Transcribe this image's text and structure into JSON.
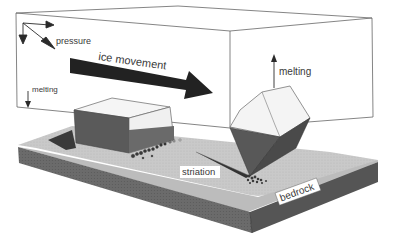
{
  "diagram": {
    "labels": {
      "pressure": "pressure",
      "ice_movement": "ice movement",
      "melting_left": "melting",
      "melting_right": "melting",
      "striation": "striation",
      "bedrock": "bedrock"
    },
    "colors": {
      "background": "#ffffff",
      "ice_line": "#555555",
      "bedrock_top": "#c8c8c8",
      "bedrock_side": "#6a6a6a",
      "rock_shadow": "#4a4a4a",
      "arrow": "#2a2a2a",
      "debris": "#3a3a3a"
    },
    "icons": {
      "pressure_arrows": "three-arrows-icon",
      "ice_movement_arrow": "big-right-arrow-icon",
      "melting_down_arrow": "down-arrow-icon",
      "melting_up_arrow": "up-arrow-icon"
    }
  }
}
